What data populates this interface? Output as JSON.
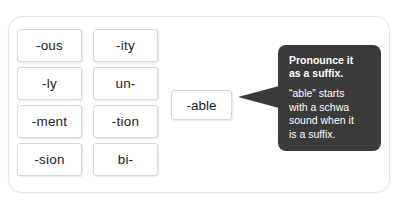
{
  "card": {
    "label": "word sort activity card"
  },
  "tiles": {
    "rows": [
      [
        {
          "text": "-ous",
          "name": "word-tile-ous"
        },
        {
          "text": "-ity",
          "name": "word-tile-ity"
        }
      ],
      [
        {
          "text": "-ly",
          "name": "word-tile-ly"
        },
        {
          "text": "un-",
          "name": "word-tile-un"
        }
      ],
      [
        {
          "text": "-ment",
          "name": "word-tile-ment"
        },
        {
          "text": "-tion",
          "name": "word-tile-tion"
        }
      ],
      [
        {
          "text": "-sion",
          "name": "word-tile-sion"
        },
        {
          "text": "bi-",
          "name": "word-tile-bi"
        }
      ]
    ]
  },
  "target": {
    "text": "-able"
  },
  "tooltip": {
    "heading": "Pronounce it\nas a suffix.",
    "body": "“able” starts\nwith a schwa\nsound when it\nis a suffix.",
    "background_color": "#3a3a3a",
    "text_color": "#ffffff"
  }
}
